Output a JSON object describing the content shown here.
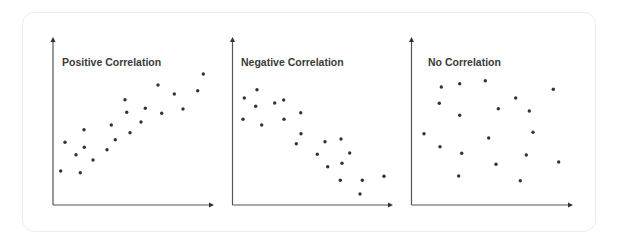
{
  "colors": {
    "axis": "#555555",
    "point": "#333333",
    "title": "#3a3a3a",
    "card_border": "#ececec"
  },
  "chart_data": [
    {
      "type": "scatter",
      "title": "Positive Correlation",
      "xlabel": "",
      "ylabel": "",
      "grid": false,
      "legend": null,
      "axes": {
        "x0": 53,
        "y0": 205,
        "x1": 214,
        "ytop": 37
      },
      "title_pos": {
        "x": 62,
        "y": 66
      },
      "points": [
        [
          60.7,
          171
        ],
        [
          65,
          142.3
        ],
        [
          76,
          154.7
        ],
        [
          80.3,
          172.7
        ],
        [
          84,
          129.7
        ],
        [
          84.3,
          147.3
        ],
        [
          93,
          160
        ],
        [
          107,
          149.7
        ],
        [
          111.3,
          125
        ],
        [
          115.3,
          139.7
        ],
        [
          125,
          99.7
        ],
        [
          126.7,
          112.3
        ],
        [
          130,
          132.7
        ],
        [
          141,
          122
        ],
        [
          145.3,
          108.3
        ],
        [
          158,
          85
        ],
        [
          161.7,
          113.3
        ],
        [
          174.3,
          94
        ],
        [
          183,
          109
        ],
        [
          197.7,
          90.7
        ],
        [
          203.3,
          74
        ]
      ]
    },
    {
      "type": "scatter",
      "title": "Negative Correlation",
      "xlabel": "",
      "ylabel": "",
      "grid": false,
      "legend": null,
      "axes": {
        "x0": 232.5,
        "y0": 205,
        "x1": 393,
        "ytop": 37
      },
      "title_pos": {
        "x": 241,
        "y": 66
      },
      "points": [
        [
          244.3,
          98
        ],
        [
          257,
          89.7
        ],
        [
          255.7,
          106.3
        ],
        [
          243,
          119.3
        ],
        [
          261.7,
          125
        ],
        [
          274.7,
          103
        ],
        [
          283.7,
          100
        ],
        [
          284,
          119.3
        ],
        [
          300.7,
          112.7
        ],
        [
          301,
          133.7
        ],
        [
          296.3,
          143.7
        ],
        [
          325,
          141.7
        ],
        [
          341,
          139
        ],
        [
          317.3,
          154.3
        ],
        [
          349.7,
          153
        ],
        [
          327.7,
          166.7
        ],
        [
          342,
          163.3
        ],
        [
          340.3,
          180.3
        ],
        [
          362.3,
          180.3
        ],
        [
          360,
          194
        ],
        [
          384,
          176.3
        ]
      ]
    },
    {
      "type": "scatter",
      "title": "No Correlation",
      "xlabel": "",
      "ylabel": "",
      "grid": false,
      "legend": null,
      "axes": {
        "x0": 411.5,
        "y0": 205,
        "x1": 573,
        "ytop": 37
      },
      "title_pos": {
        "x": 428,
        "y": 66
      },
      "points": [
        [
          441.3,
          87
        ],
        [
          459.7,
          83.7
        ],
        [
          485.3,
          80.7
        ],
        [
          439.3,
          103.3
        ],
        [
          459.7,
          115.3
        ],
        [
          424,
          133.7
        ],
        [
          440,
          146.7
        ],
        [
          461.7,
          153.3
        ],
        [
          458.7,
          176
        ],
        [
          488.7,
          138
        ],
        [
          498.3,
          108.7
        ],
        [
          496,
          164.3
        ],
        [
          515.7,
          98
        ],
        [
          529.3,
          111
        ],
        [
          533,
          132.3
        ],
        [
          526.3,
          155
        ],
        [
          520.3,
          180.7
        ],
        [
          553.3,
          89.3
        ],
        [
          558.7,
          162
        ]
      ]
    }
  ]
}
